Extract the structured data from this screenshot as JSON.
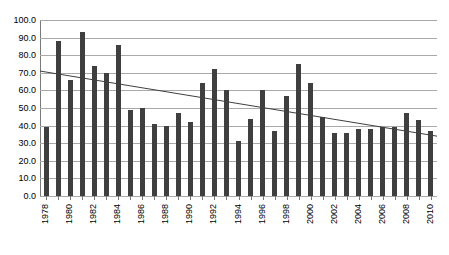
{
  "chart_data": {
    "type": "bar",
    "title": "",
    "subtitle": "",
    "xlabel": "",
    "ylabel": "",
    "ylim": [
      0,
      100
    ],
    "yticks": [
      "0.0",
      "10.0",
      "20.0",
      "30.0",
      "40.0",
      "50.0",
      "60.0",
      "70.0",
      "80.0",
      "90.0",
      "100.0"
    ],
    "ytick_values": [
      0,
      10,
      20,
      30,
      40,
      50,
      60,
      70,
      80,
      90,
      100
    ],
    "grid": true,
    "legend": "none",
    "categories": [
      "1978",
      "1979",
      "1980",
      "1981",
      "1982",
      "1983",
      "1984",
      "1985",
      "1986",
      "1987",
      "1988",
      "1989",
      "1990",
      "1991",
      "1992",
      "1993",
      "1994",
      "1995",
      "1996",
      "1997",
      "1998",
      "1999",
      "2000",
      "2001",
      "2002",
      "2003",
      "2004",
      "2005",
      "2006",
      "2007",
      "2008",
      "2009",
      "2010"
    ],
    "xtick_labels_shown": [
      "1978",
      "1980",
      "1982",
      "1984",
      "1986",
      "1988",
      "1990",
      "1992",
      "1994",
      "1996",
      "1998",
      "2000",
      "2002",
      "2004",
      "2006",
      "2008",
      "2010"
    ],
    "values": [
      39,
      88,
      66,
      93,
      74,
      70,
      86,
      49,
      50,
      41,
      40,
      47,
      42,
      64,
      72,
      60,
      31,
      44,
      60,
      37,
      57,
      75,
      64,
      45,
      36,
      36,
      38,
      38,
      39,
      39,
      47,
      43,
      37
    ],
    "series": [
      {
        "name": "bars",
        "type": "bar",
        "color": "#3f3f3f",
        "values": [
          39,
          88,
          66,
          93,
          74,
          70,
          86,
          49,
          50,
          41,
          40,
          47,
          42,
          64,
          72,
          60,
          31,
          44,
          60,
          37,
          57,
          75,
          64,
          45,
          36,
          36,
          38,
          38,
          39,
          39,
          47,
          43,
          37
        ]
      },
      {
        "name": "linear-trendline",
        "type": "line",
        "color": "#3f3f3f",
        "start_x": "1978",
        "end_x": "2010",
        "start_value": 71,
        "end_value": 34
      }
    ]
  }
}
